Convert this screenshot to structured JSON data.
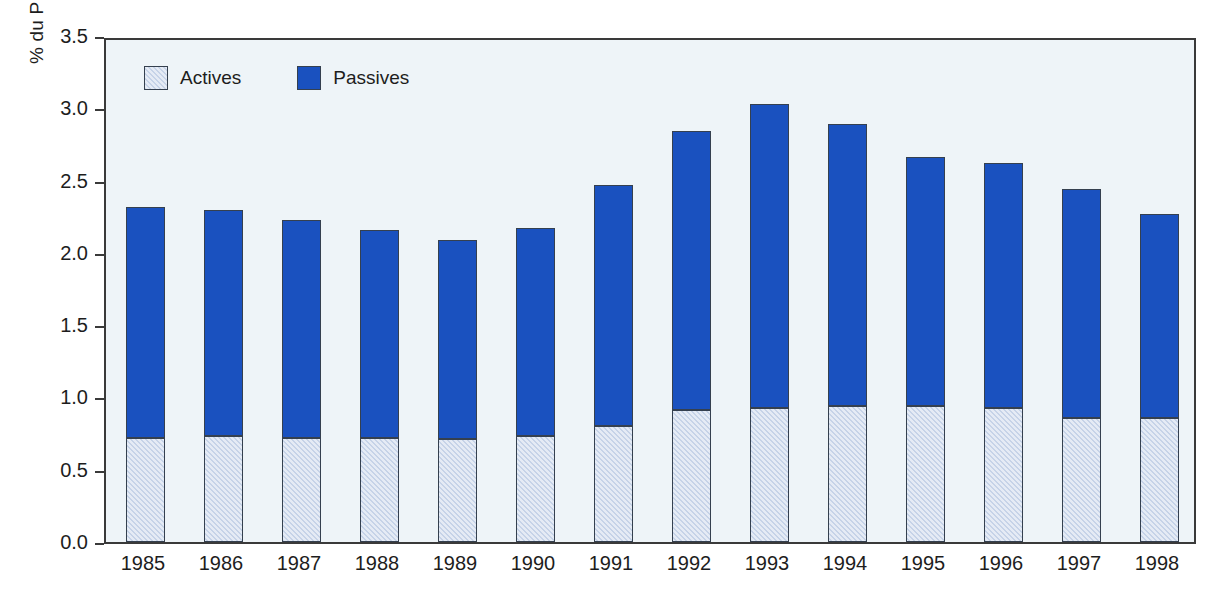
{
  "chart_data": {
    "type": "bar",
    "stacked": true,
    "title": "",
    "subtitle": "",
    "xlabel": "",
    "ylabel": "% du PIB",
    "ylim": [
      0.0,
      3.5
    ],
    "ytick_labels": [
      "0.0",
      "0.5",
      "1.0",
      "1.5",
      "2.0",
      "2.5",
      "3.0",
      "3.5"
    ],
    "ytick_values": [
      0.0,
      0.5,
      1.0,
      1.5,
      2.0,
      2.5,
      3.0,
      3.5
    ],
    "grid": false,
    "legend_position": "top-left inside plot",
    "categories": [
      "1985",
      "1986",
      "1987",
      "1988",
      "1989",
      "1990",
      "1991",
      "1992",
      "1993",
      "1994",
      "1995",
      "1996",
      "1997",
      "1998"
    ],
    "series": [
      {
        "name": "Actives",
        "color": "#c6d3e8",
        "values": [
          0.72,
          0.73,
          0.72,
          0.72,
          0.71,
          0.73,
          0.8,
          0.91,
          0.93,
          0.94,
          0.94,
          0.93,
          0.86,
          0.86
        ]
      },
      {
        "name": "Passives",
        "color": "#1a51bf",
        "values": [
          1.6,
          1.57,
          1.51,
          1.44,
          1.38,
          1.44,
          1.67,
          1.93,
          2.1,
          1.95,
          1.72,
          1.69,
          1.58,
          1.41
        ]
      }
    ],
    "totals": [
      2.32,
      2.3,
      2.23,
      2.16,
      2.09,
      2.17,
      2.47,
      2.84,
      3.03,
      2.89,
      2.66,
      2.62,
      2.44,
      2.27
    ],
    "colors": {
      "actives": "#c6d3e8",
      "passives": "#1a51bf",
      "plot_background": "#eef4f8",
      "axis": "#3a3a3a",
      "bar_border": "#35404f",
      "text": "#1d1d1d",
      "page_background": "#ffffff"
    }
  },
  "legend": {
    "items": [
      {
        "label": "Actives",
        "swatch": "actives"
      },
      {
        "label": "Passives",
        "swatch": "passives"
      }
    ]
  }
}
